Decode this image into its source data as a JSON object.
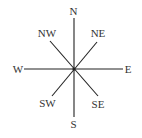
{
  "diagram": {
    "type": "compass-rose",
    "center": {
      "x": 74,
      "y": 69
    },
    "line_color": "#222222",
    "text_color": "#333333",
    "labels": {
      "n": "N",
      "ne": "NE",
      "e": "E",
      "se": "SE",
      "s": "S",
      "sw": "SW",
      "w": "W",
      "nw": "NW"
    }
  }
}
